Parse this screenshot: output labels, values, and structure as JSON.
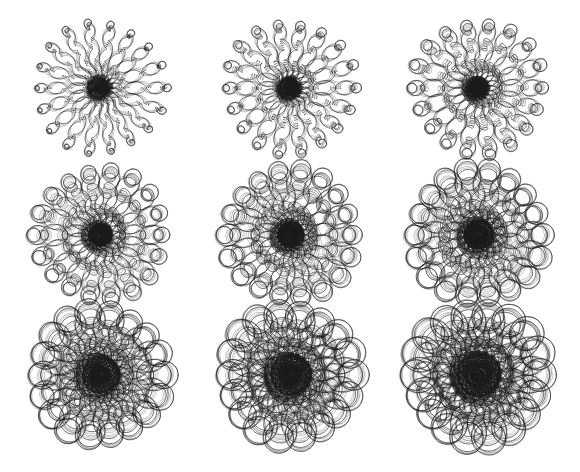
{
  "figure": {
    "width": 580,
    "height": 472,
    "background_color": "#ffffff",
    "stroke_color": "#1a1a1a",
    "stroke_width": 0.75,
    "title": "",
    "caption": "",
    "kind": "parameter-sweep-grid"
  },
  "grid": {
    "rows": 3,
    "cols": 3,
    "col_centers": [
      100,
      290,
      478
    ],
    "row_centers": [
      88,
      235,
      375
    ]
  },
  "chart_data": {
    "type": "scatter",
    "title": "",
    "xlabel": "",
    "ylabel": "",
    "grid": false,
    "legend": "none",
    "description": "Three-by-three grid of radial loop curves (rose / epitrochoid family). Each panel draws a closed parametric curve with a fixed number of radial petals and small secondary loops riding along each petal. The secondary loop amplitude increases from left to right across the columns and from top to bottom down the rows, so the top-left panel is a tight spiky star and the bottom-right panel is a dense mass of large open loops.",
    "parameter_swept": "loop_amplitude",
    "panels": [
      {
        "index": 0,
        "row": 0,
        "col": 0,
        "cx": 100,
        "cy": 88,
        "petals": 18,
        "base_radius": 34,
        "petal_amplitude": 32,
        "loop_count": 9,
        "loop_amplitude": 3.0,
        "core_darkness": 0.95,
        "extent": 70,
        "appearance": "tight spiky star, very small beads"
      },
      {
        "index": 1,
        "row": 0,
        "col": 1,
        "cx": 290,
        "cy": 88,
        "petals": 18,
        "base_radius": 34,
        "petal_amplitude": 32,
        "loop_count": 9,
        "loop_amplitude": 4.2,
        "core_darkness": 0.93,
        "extent": 72,
        "appearance": "spiky star, small beads"
      },
      {
        "index": 2,
        "row": 0,
        "col": 2,
        "cx": 478,
        "cy": 88,
        "petals": 18,
        "base_radius": 34,
        "petal_amplitude": 32,
        "loop_count": 9,
        "loop_amplitude": 5.6,
        "core_darkness": 0.9,
        "extent": 74,
        "appearance": "star arms resolving into visible rings"
      },
      {
        "index": 3,
        "row": 1,
        "col": 0,
        "cx": 100,
        "cy": 235,
        "petals": 18,
        "base_radius": 34,
        "petal_amplitude": 31,
        "loop_count": 9,
        "loop_amplitude": 7.4,
        "core_darkness": 0.85,
        "extent": 76,
        "appearance": "open looped arms, dark core"
      },
      {
        "index": 4,
        "row": 1,
        "col": 1,
        "cx": 290,
        "cy": 235,
        "petals": 18,
        "base_radius": 34,
        "petal_amplitude": 31,
        "loop_count": 9,
        "loop_amplitude": 9.0,
        "core_darkness": 0.82,
        "extent": 78,
        "appearance": "larger teardrop loops along each arm"
      },
      {
        "index": 5,
        "row": 1,
        "col": 2,
        "cx": 478,
        "cy": 235,
        "petals": 18,
        "base_radius": 34,
        "petal_amplitude": 31,
        "loop_count": 9,
        "loop_amplitude": 10.6,
        "core_darkness": 0.8,
        "extent": 80,
        "appearance": "prominent bow-tie loops, compact dark core"
      },
      {
        "index": 6,
        "row": 2,
        "col": 0,
        "cx": 100,
        "cy": 375,
        "petals": 18,
        "base_radius": 34,
        "petal_amplitude": 29,
        "loop_count": 9,
        "loop_amplitude": 12.6,
        "core_darkness": 0.75,
        "extent": 82,
        "appearance": "large overlapping loops, arms nearly lost"
      },
      {
        "index": 7,
        "row": 2,
        "col": 1,
        "cx": 290,
        "cy": 375,
        "petals": 18,
        "base_radius": 34,
        "petal_amplitude": 29,
        "loop_count": 9,
        "loop_amplitude": 14.2,
        "core_darkness": 0.72,
        "extent": 84,
        "appearance": "dense tangle of large loops"
      },
      {
        "index": 8,
        "row": 2,
        "col": 2,
        "cx": 478,
        "cy": 375,
        "petals": 18,
        "base_radius": 34,
        "petal_amplitude": 29,
        "loop_count": 9,
        "loop_amplitude": 15.8,
        "core_darkness": 0.7,
        "extent": 86,
        "appearance": "largest loops, radial structure fully blurred"
      }
    ]
  }
}
